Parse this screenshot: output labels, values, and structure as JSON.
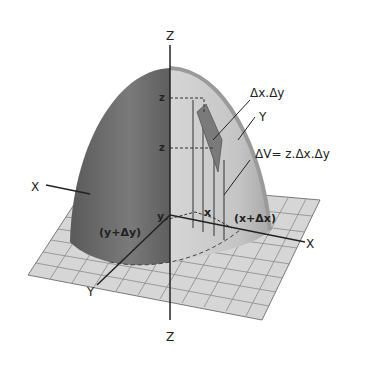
{
  "figure": {
    "axes": {
      "z_top": "Z",
      "z_bottom": "Z",
      "x_left": "X",
      "x_right": "X",
      "y_right_upper": "Y",
      "y_bottom_left": "Y"
    },
    "labels": {
      "area_element": "Δx.Δy",
      "volume_element": "ΔV= z.Δx.Δy",
      "z_upper": "z",
      "z_lower": "z",
      "x_point": "x",
      "x_plus_dx": "(x+Δx)",
      "y_point": "y",
      "y_plus_dy": "(y+Δy)"
    },
    "colors": {
      "surface_dark": "#6e6e6e",
      "surface_light": "#c8c8c8",
      "grid_plane": "#d4d4d4",
      "grid_lines": "#8a8a8a",
      "element": "#7a7a7a",
      "axis": "#222222"
    }
  }
}
